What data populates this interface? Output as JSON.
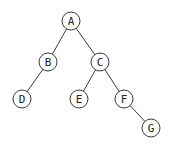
{
  "diagram": {
    "type": "binary-tree",
    "nodes": [
      {
        "id": "A",
        "label": "A",
        "x": 71,
        "y": 21
      },
      {
        "id": "B",
        "label": "B",
        "x": 48,
        "y": 62
      },
      {
        "id": "C",
        "label": "C",
        "x": 100,
        "y": 62
      },
      {
        "id": "D",
        "label": "D",
        "x": 22,
        "y": 99
      },
      {
        "id": "E",
        "label": "E",
        "x": 79,
        "y": 99
      },
      {
        "id": "F",
        "label": "F",
        "x": 124,
        "y": 99
      },
      {
        "id": "G",
        "label": "G",
        "x": 151,
        "y": 128
      }
    ],
    "edges": [
      {
        "from": "A",
        "to": "B"
      },
      {
        "from": "A",
        "to": "C"
      },
      {
        "from": "B",
        "to": "D"
      },
      {
        "from": "C",
        "to": "E"
      },
      {
        "from": "C",
        "to": "F"
      },
      {
        "from": "F",
        "to": "G"
      }
    ],
    "node_radius": 9,
    "stroke_color": "#3a3a3a"
  }
}
